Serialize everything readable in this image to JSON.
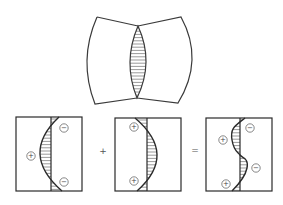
{
  "figure": {
    "top": {
      "description": "Two curved panels joined at a lens-shaped hatched weld region",
      "left_panel": [
        [
          97,
          17
        ],
        [
          138,
          26
        ],
        [
          137,
          98
        ],
        [
          95,
          104
        ]
      ],
      "left_bulge_x": 87,
      "right_panel": [
        [
          138,
          26
        ],
        [
          181,
          17
        ],
        [
          178,
          103
        ],
        [
          137,
          98
        ]
      ],
      "right_bulge_x": 192,
      "lens": {
        "top": [
          138,
          26
        ],
        "bottom": [
          137,
          98
        ],
        "left_x": 130,
        "right_x": 146
      }
    },
    "panels": [
      {
        "id": "panel-1",
        "box": {
          "x": 16,
          "y": 117,
          "w": 66,
          "h": 74
        },
        "axis_x": 51,
        "curve_type": "arc-left",
        "curve": {
          "top_x": 59,
          "mid_x": 40,
          "bottom_x": 62
        },
        "signs": [
          {
            "symbol": "+",
            "x": 31,
            "y": 156
          },
          {
            "symbol": "−",
            "x": 64,
            "y": 128
          },
          {
            "symbol": "−",
            "x": 64,
            "y": 182
          }
        ]
      },
      {
        "id": "panel-2",
        "box": {
          "x": 115,
          "y": 118,
          "w": 66,
          "h": 73
        },
        "axis_x": 147,
        "curve_type": "arc-right",
        "curve": {
          "top_x": 135,
          "mid_x": 157,
          "bottom_x": 137
        },
        "signs": [
          {
            "symbol": "+",
            "x": 134,
            "y": 127
          },
          {
            "symbol": "+",
            "x": 134,
            "y": 181
          }
        ]
      },
      {
        "id": "panel-3",
        "box": {
          "x": 206,
          "y": 118,
          "w": 66,
          "h": 73
        },
        "axis_x": 240,
        "curve_type": "s-curve",
        "curve": {
          "top_x": 245,
          "left_peak_x": 232,
          "left_peak_y": 140,
          "cross_y": 155,
          "right_peak_x": 247,
          "right_peak_y": 168,
          "bottom_x": 232
        },
        "signs": [
          {
            "symbol": "−",
            "x": 250,
            "y": 128
          },
          {
            "symbol": "+",
            "x": 223,
            "y": 140
          },
          {
            "symbol": "−",
            "x": 256,
            "y": 168
          },
          {
            "symbol": "+",
            "x": 226,
            "y": 184
          }
        ]
      }
    ],
    "operators": [
      {
        "symbol": "+",
        "x": 103,
        "y": 151
      },
      {
        "symbol": "=",
        "x": 195,
        "y": 150
      }
    ]
  }
}
